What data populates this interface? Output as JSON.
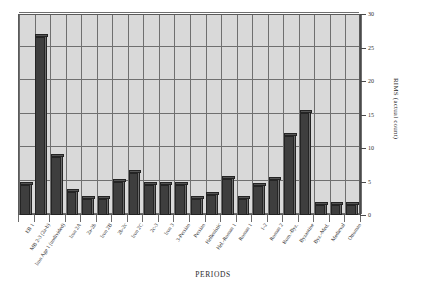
{
  "chart_data": {
    "type": "bar",
    "title": "",
    "xlabel": "PERIODS",
    "ylabel": "RIMS (actual count)",
    "ylim": [
      0,
      30
    ],
    "yticks": [
      0,
      5,
      10,
      15,
      20,
      25,
      30
    ],
    "grid": true,
    "legend": "none",
    "categories": [
      "EB 1",
      "MB 2-3 (2a-b)",
      "Iron Age 1 (undivided)",
      "Iron 2A",
      "2a-2b",
      "Iron 2B",
      "2b-2c",
      "Iron 2C",
      "2c-3",
      "Iron 3",
      "3-Persian",
      "Persian",
      "Hellenistic",
      "Hel.-Roman 1",
      "Roman 1",
      "1-2",
      "Roman 2",
      "Rom.-Byz.",
      "Byzantine",
      "Byz.-Med.",
      "Medieval",
      "Ottoman"
    ],
    "values": [
      4.5,
      26.5,
      8.7,
      3.4,
      2.4,
      2.4,
      5.0,
      6.3,
      4.5,
      4.5,
      4.5,
      2.4,
      3.0,
      5.4,
      2.4,
      4.4,
      5.3,
      11.8,
      15.2,
      1.5,
      1.5,
      1.5
    ]
  },
  "axis": {
    "tick_labels": [
      "0",
      "5",
      "10",
      "15",
      "20",
      "25",
      "30"
    ],
    "y_title": "RIMS (actual count)",
    "x_title": "PERIODS"
  },
  "colors": {
    "plot_background": "#d9d9d9",
    "bar_front": "#3e3e3e",
    "bar_side": "#6a6a6a",
    "bar_top": "#545454",
    "grid": "#6f6f6f",
    "axis": "#4a4a4a",
    "text": "#2b2b2b",
    "page_background": "#ffffff"
  }
}
